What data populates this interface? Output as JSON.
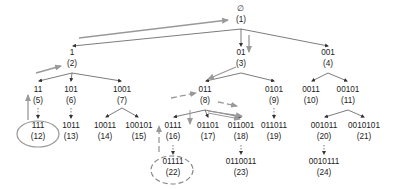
{
  "diagram": {
    "title": "",
    "colors": {
      "edge": "#333333",
      "traversal": "#999999",
      "text": "#222222"
    },
    "nodes": [
      {
        "id": 1,
        "label": "∅",
        "index": "(1)",
        "x": 241,
        "y": 4
      },
      {
        "id": 2,
        "label": "1",
        "index": "(2)",
        "x": 72,
        "y": 48
      },
      {
        "id": 3,
        "label": "01",
        "index": "(3)",
        "x": 241,
        "y": 48
      },
      {
        "id": 4,
        "label": "001",
        "index": "(4)",
        "x": 328,
        "y": 48
      },
      {
        "id": 5,
        "label": "11",
        "index": "(5)",
        "x": 38,
        "y": 85
      },
      {
        "id": 6,
        "label": "101",
        "index": "(6)",
        "x": 71,
        "y": 85
      },
      {
        "id": 7,
        "label": "1001",
        "index": "(7)",
        "x": 122,
        "y": 85
      },
      {
        "id": 8,
        "label": "011",
        "index": "(8)",
        "x": 205,
        "y": 85
      },
      {
        "id": 9,
        "label": "0101",
        "index": "(9)",
        "x": 274,
        "y": 85
      },
      {
        "id": 10,
        "label": "0011",
        "index": "(10)",
        "x": 311,
        "y": 85
      },
      {
        "id": 11,
        "label": "00101",
        "index": "(11)",
        "x": 348,
        "y": 85
      },
      {
        "id": 12,
        "label": "111",
        "index": "(12)",
        "x": 38,
        "y": 121
      },
      {
        "id": 13,
        "label": "1011",
        "index": "(13)",
        "x": 71,
        "y": 121
      },
      {
        "id": 14,
        "label": "10011",
        "index": "(14)",
        "x": 105,
        "y": 121
      },
      {
        "id": 15,
        "label": "100101",
        "index": "(15)",
        "x": 139,
        "y": 121
      },
      {
        "id": 16,
        "label": "0111",
        "index": "(16)",
        "x": 173,
        "y": 121
      },
      {
        "id": 17,
        "label": "01101",
        "index": "(17)",
        "x": 208,
        "y": 121
      },
      {
        "id": 18,
        "label": "011001",
        "index": "(18)",
        "x": 241,
        "y": 121
      },
      {
        "id": 19,
        "label": "011011",
        "index": "(19)",
        "x": 274,
        "y": 121
      },
      {
        "id": 20,
        "label": "001011",
        "index": "(20)",
        "x": 324,
        "y": 121
      },
      {
        "id": 21,
        "label": "0010101",
        "index": "(21)",
        "x": 364,
        "y": 121
      },
      {
        "id": 22,
        "label": "01111",
        "index": "(22)",
        "x": 173,
        "y": 157
      },
      {
        "id": 23,
        "label": "0110011",
        "index": "(23)",
        "x": 241,
        "y": 157
      },
      {
        "id": 24,
        "label": "0010111",
        "index": "(24)",
        "x": 324,
        "y": 157
      }
    ],
    "edges": [
      [
        1,
        2
      ],
      [
        1,
        3
      ],
      [
        1,
        4
      ],
      [
        2,
        5
      ],
      [
        2,
        6
      ],
      [
        2,
        7
      ],
      [
        3,
        8
      ],
      [
        3,
        9
      ],
      [
        4,
        10
      ],
      [
        4,
        11
      ],
      [
        5,
        12
      ],
      [
        6,
        13
      ],
      [
        7,
        14
      ],
      [
        7,
        15
      ],
      [
        8,
        16
      ],
      [
        8,
        17
      ],
      [
        8,
        18
      ],
      [
        9,
        19
      ],
      [
        11,
        20
      ],
      [
        11,
        21
      ],
      [
        16,
        22
      ],
      [
        18,
        23
      ],
      [
        20,
        24
      ]
    ],
    "highlights": [
      {
        "node": 12,
        "style": "solid-ellipse"
      },
      {
        "node": 22,
        "style": "dashed-ellipse"
      }
    ]
  }
}
